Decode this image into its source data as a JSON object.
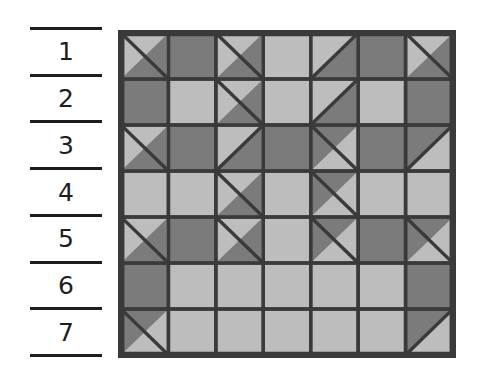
{
  "figure": {
    "colors": {
      "light": "#bdbdbd",
      "medium": "#9a9a9a",
      "dark": "#7b7b7b",
      "line": "#3a3a3a",
      "background": "#ffffff",
      "text": "#1d1d1d"
    }
  },
  "legend": {
    "name": "row-number-key",
    "rows": [
      "1",
      "2",
      "3",
      "4",
      "5",
      "6",
      "7"
    ]
  },
  "quilt": {
    "rows": 7,
    "cols": 7,
    "cell_size": 47,
    "grid": [
      [
        {
          "type": "tri",
          "diag": "tlbr",
          "a": "light",
          "b": "dark"
        },
        {
          "type": "solid",
          "a": "dark"
        },
        {
          "type": "tri",
          "diag": "tlbr",
          "a": "light",
          "b": "dark"
        },
        {
          "type": "solid",
          "a": "light"
        },
        {
          "type": "tri",
          "diag": "trbl",
          "a": "light",
          "b": "dark"
        },
        {
          "type": "solid",
          "a": "dark"
        },
        {
          "type": "tri",
          "diag": "tlbr",
          "a": "light",
          "b": "dark"
        }
      ],
      [
        {
          "type": "solid",
          "a": "dark"
        },
        {
          "type": "solid",
          "a": "light"
        },
        {
          "type": "tri",
          "diag": "tlbr",
          "a": "light",
          "b": "dark"
        },
        {
          "type": "solid",
          "a": "light"
        },
        {
          "type": "tri",
          "diag": "trbl",
          "a": "light",
          "b": "dark"
        },
        {
          "type": "solid",
          "a": "light"
        },
        {
          "type": "solid",
          "a": "dark"
        }
      ],
      [
        {
          "type": "tri",
          "diag": "tlbr",
          "a": "light",
          "b": "dark"
        },
        {
          "type": "solid",
          "a": "dark"
        },
        {
          "type": "tri",
          "diag": "trbl",
          "a": "light",
          "b": "dark"
        },
        {
          "type": "solid",
          "a": "dark"
        },
        {
          "type": "tri",
          "diag": "tlbr",
          "a": "dark",
          "b": "light"
        },
        {
          "type": "solid",
          "a": "dark"
        },
        {
          "type": "tri",
          "diag": "trbl",
          "a": "dark",
          "b": "light"
        }
      ],
      [
        {
          "type": "solid",
          "a": "light"
        },
        {
          "type": "solid",
          "a": "light"
        },
        {
          "type": "tri",
          "diag": "tlbr",
          "a": "light",
          "b": "dark"
        },
        {
          "type": "solid",
          "a": "light"
        },
        {
          "type": "tri",
          "diag": "tlbr",
          "a": "dark",
          "b": "light"
        },
        {
          "type": "solid",
          "a": "light"
        },
        {
          "type": "solid",
          "a": "light"
        }
      ],
      [
        {
          "type": "tri",
          "diag": "tlbr",
          "a": "light",
          "b": "dark"
        },
        {
          "type": "solid",
          "a": "dark"
        },
        {
          "type": "tri",
          "diag": "tlbr",
          "a": "light",
          "b": "dark"
        },
        {
          "type": "solid",
          "a": "light"
        },
        {
          "type": "tri",
          "diag": "tlbr",
          "a": "dark",
          "b": "light"
        },
        {
          "type": "solid",
          "a": "dark"
        },
        {
          "type": "tri",
          "diag": "tlbr",
          "a": "dark",
          "b": "light"
        }
      ],
      [
        {
          "type": "solid",
          "a": "dark"
        },
        {
          "type": "solid",
          "a": "light"
        },
        {
          "type": "solid",
          "a": "light"
        },
        {
          "type": "solid",
          "a": "light"
        },
        {
          "type": "solid",
          "a": "light"
        },
        {
          "type": "solid",
          "a": "light"
        },
        {
          "type": "solid",
          "a": "dark"
        }
      ],
      [
        {
          "type": "tri",
          "diag": "tlbr",
          "a": "dark",
          "b": "light"
        },
        {
          "type": "solid",
          "a": "light"
        },
        {
          "type": "solid",
          "a": "light"
        },
        {
          "type": "solid",
          "a": "light"
        },
        {
          "type": "solid",
          "a": "light"
        },
        {
          "type": "solid",
          "a": "light"
        },
        {
          "type": "tri",
          "diag": "trbl",
          "a": "dark",
          "b": "light"
        }
      ]
    ]
  }
}
